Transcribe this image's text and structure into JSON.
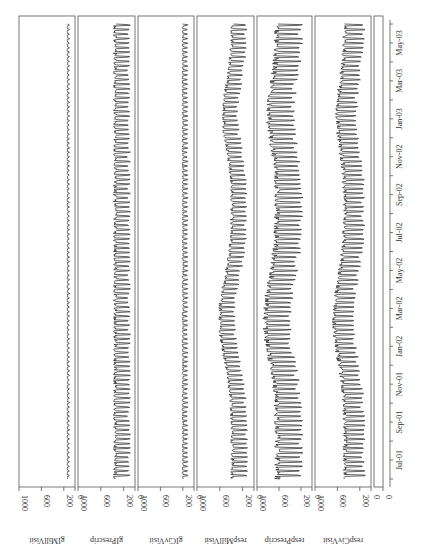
{
  "chart_data": {
    "type": "line",
    "title": "",
    "orientation": "rotated-90-ccw",
    "x": {
      "label": "",
      "ticks": [
        "Jul-01",
        "Sep-01",
        "Nov-01",
        "Jan-02",
        "Mar-02",
        "May-02",
        "Jul-02",
        "Sep-02",
        "Nov-02",
        "Jan-03",
        "Mar-03",
        "May-03"
      ],
      "range": [
        "Jun-01",
        "Jun-03"
      ]
    },
    "panels": [
      {
        "name": "gIMillVisit",
        "ylim": [
          0,
          1000
        ],
        "yticks": [
          0,
          200,
          600,
          1000
        ],
        "baseline": 120,
        "amplitude": 20,
        "trend": 0
      },
      {
        "name": "gIPrescrip",
        "ylim": [
          0,
          1000
        ],
        "yticks": [
          0,
          200,
          600,
          1000
        ],
        "baseline": 230,
        "amplitude": 150,
        "trend": 0
      },
      {
        "name": "gICivVisit",
        "ylim": [
          0,
          1000
        ],
        "yticks": [
          0,
          200,
          600,
          1000
        ],
        "baseline": 160,
        "amplitude": 50,
        "trend": 0
      },
      {
        "name": "respMillVisit",
        "ylim": [
          0,
          1000
        ],
        "yticks": [
          0,
          200,
          600,
          1000
        ],
        "baseline": 260,
        "amplitude": 150,
        "trend": 220
      },
      {
        "name": "respPrescrip",
        "ylim": [
          0,
          1000
        ],
        "yticks": [
          0,
          200,
          600,
          1000
        ],
        "baseline": 420,
        "amplitude": 260,
        "trend": 220
      },
      {
        "name": "respCivVisit",
        "ylim": [
          0,
          1000
        ],
        "yticks": [
          0,
          200,
          600,
          1000
        ],
        "baseline": 300,
        "amplitude": 200,
        "trend": 200
      },
      {
        "name": "",
        "ylim": [
          0,
          1000
        ],
        "yticks": [
          0
        ],
        "baseline": 0,
        "amplitude": 0,
        "trend": 0
      }
    ],
    "series_description": "Weekly counts with strong day-of-week oscillation; resp series show winter peaks (Jan–Mar 2002, Nov 2002–Mar 2003)."
  }
}
